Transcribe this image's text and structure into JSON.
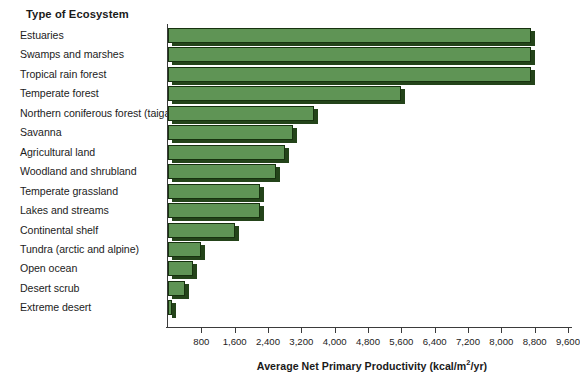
{
  "chart_data": {
    "type": "bar",
    "orientation": "horizontal",
    "title": "Type of Ecosystem",
    "xlabel": "Average Net Primary Productivity (kcal/m²/yr)",
    "ylabel": "Type of Ecosystem",
    "xlim": [
      0,
      9600
    ],
    "xticks": [
      800,
      1600,
      2400,
      3200,
      4000,
      4800,
      5600,
      6400,
      7200,
      8000,
      8800,
      9600
    ],
    "xtick_labels": [
      "800",
      "1,600",
      "2,400",
      "3,200",
      "4,000",
      "4,800",
      "5,600",
      "6,400",
      "7,200",
      "8,000",
      "8,800",
      "9,600"
    ],
    "grid": false,
    "legend": null,
    "series_color": "#5f9455",
    "categories": [
      "Estuaries",
      "Swamps and marshes",
      "Tropical rain forest",
      "Temperate forest",
      "Northern coniferous forest (taiga)",
      "Savanna",
      "Agricultural land",
      "Woodland and shrubland",
      "Temperate grassland",
      "Lakes and streams",
      "Continental shelf",
      "Tundra (arctic and alpine)",
      "Open ocean",
      "Desert scrub",
      "Extreme desert"
    ],
    "values": [
      8700,
      8700,
      8700,
      5600,
      3500,
      3000,
      2800,
      2600,
      2200,
      2200,
      1600,
      800,
      600,
      400,
      100
    ]
  },
  "heading": {
    "label": "Type of Ecosystem"
  },
  "axis_title": {
    "prefix": "Average Net Primary Productivity (kcal/m",
    "superscript": "2",
    "suffix": "/yr)"
  }
}
